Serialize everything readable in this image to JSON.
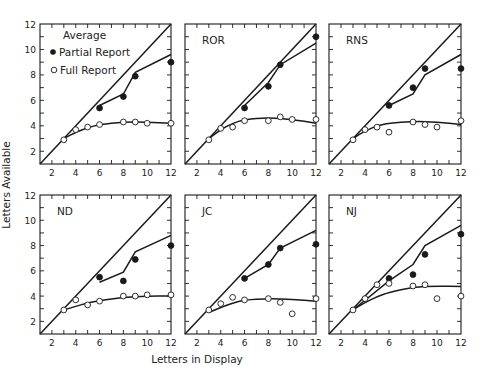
{
  "figure": {
    "xlabel": "Letters in Display",
    "ylabel": "Letters Available",
    "colors": {
      "ink": "#1a1a1a",
      "background": "#ffffff",
      "open_marker_fill": "#ffffff"
    },
    "legend": {
      "title": "Average",
      "items": [
        {
          "label": "Partial Report",
          "marker": "filled-circle"
        },
        {
          "label": "Full Report",
          "marker": "open-circle"
        }
      ]
    }
  },
  "chart_data": [
    {
      "type": "line",
      "title": "Average",
      "panel_label": "",
      "xlabel": "Letters in Display",
      "ylabel": "Letters Available",
      "xlim": [
        1,
        12
      ],
      "ylim": [
        1,
        12
      ],
      "xticks": [
        2,
        4,
        6,
        8,
        10,
        12
      ],
      "yticks": [
        2,
        4,
        6,
        8,
        10,
        12
      ],
      "grid": false,
      "diagonal": [
        [
          1,
          1
        ],
        [
          12,
          12
        ]
      ],
      "series": [
        {
          "name": "Partial Report",
          "marker": "filled",
          "x": [
            6,
            8,
            9,
            12
          ],
          "values": [
            5.4,
            6.3,
            7.9,
            9.0
          ]
        },
        {
          "name": "Full Report",
          "marker": "open",
          "x": [
            3,
            4,
            5,
            6,
            8,
            9,
            10,
            12
          ],
          "values": [
            2.9,
            3.7,
            3.9,
            4.1,
            4.3,
            4.3,
            4.2,
            4.2
          ]
        }
      ],
      "fit_lines": {
        "partial": [
          [
            6,
            5.6
          ],
          [
            8,
            6.5
          ],
          [
            9,
            8.2
          ],
          [
            12,
            9.6
          ]
        ],
        "full": [
          [
            3,
            3.0
          ],
          [
            4,
            3.5
          ],
          [
            5,
            3.85
          ],
          [
            6,
            4.1
          ],
          [
            8,
            4.3
          ],
          [
            10,
            4.3
          ],
          [
            12,
            4.2
          ]
        ]
      }
    },
    {
      "type": "line",
      "title": "ROR",
      "panel_label": "ROR",
      "xlim": [
        1,
        12
      ],
      "ylim": [
        1,
        12
      ],
      "xticks": [
        2,
        4,
        6,
        8,
        10,
        12
      ],
      "yticks": [
        2,
        4,
        6,
        8,
        10,
        12
      ],
      "grid": false,
      "diagonal": [
        [
          1,
          1
        ],
        [
          12,
          12
        ]
      ],
      "series": [
        {
          "name": "Partial Report",
          "marker": "filled",
          "x": [
            6,
            8,
            9,
            12
          ],
          "values": [
            5.4,
            7.1,
            8.8,
            11.0
          ]
        },
        {
          "name": "Full Report",
          "marker": "open",
          "x": [
            3,
            4,
            5,
            6,
            8,
            9,
            10,
            12
          ],
          "values": [
            2.9,
            3.8,
            3.9,
            4.4,
            4.4,
            4.7,
            4.5,
            4.5
          ]
        }
      ],
      "fit_lines": {
        "partial": [
          [
            6,
            5.6
          ],
          [
            8,
            7.4
          ],
          [
            9,
            8.8
          ],
          [
            12,
            10.5
          ]
        ],
        "full": [
          [
            3,
            3.0
          ],
          [
            4,
            3.7
          ],
          [
            5,
            4.2
          ],
          [
            6,
            4.5
          ],
          [
            8,
            4.65
          ],
          [
            10,
            4.5
          ],
          [
            12,
            4.2
          ]
        ]
      }
    },
    {
      "type": "line",
      "title": "RNS",
      "panel_label": "RNS",
      "xlim": [
        1,
        12
      ],
      "ylim": [
        1,
        12
      ],
      "xticks": [
        2,
        4,
        6,
        8,
        10,
        12
      ],
      "yticks": [
        2,
        4,
        6,
        8,
        10,
        12
      ],
      "grid": false,
      "diagonal": [
        [
          1,
          1
        ],
        [
          12,
          12
        ]
      ],
      "series": [
        {
          "name": "Partial Report",
          "marker": "filled",
          "x": [
            6,
            8,
            9,
            12
          ],
          "values": [
            5.6,
            7.0,
            8.5,
            8.5
          ]
        },
        {
          "name": "Full Report",
          "marker": "open",
          "x": [
            3,
            4,
            5,
            6,
            8,
            9,
            10,
            12
          ],
          "values": [
            2.9,
            3.7,
            3.9,
            3.5,
            4.3,
            4.1,
            3.9,
            4.4
          ]
        }
      ],
      "fit_lines": {
        "partial": [
          [
            6,
            5.6
          ],
          [
            8,
            6.5
          ],
          [
            9,
            8.0
          ],
          [
            12,
            9.6
          ]
        ],
        "full": [
          [
            3,
            3.0
          ],
          [
            4,
            3.6
          ],
          [
            5,
            4.0
          ],
          [
            6,
            4.2
          ],
          [
            8,
            4.35
          ],
          [
            10,
            4.3
          ],
          [
            12,
            4.1
          ]
        ]
      }
    },
    {
      "type": "line",
      "title": "ND",
      "panel_label": "ND",
      "xlim": [
        1,
        12
      ],
      "ylim": [
        1,
        12
      ],
      "xticks": [
        2,
        4,
        6,
        8,
        10,
        12
      ],
      "yticks": [
        2,
        4,
        6,
        8,
        10,
        12
      ],
      "grid": false,
      "diagonal": [
        [
          1,
          1
        ],
        [
          12,
          12
        ]
      ],
      "series": [
        {
          "name": "Partial Report",
          "marker": "filled",
          "x": [
            6,
            8,
            9,
            12
          ],
          "values": [
            5.5,
            5.2,
            6.9,
            8.0
          ]
        },
        {
          "name": "Full Report",
          "marker": "open",
          "x": [
            3,
            4,
            5,
            6,
            8,
            9,
            10,
            12
          ],
          "values": [
            2.9,
            3.7,
            3.3,
            3.6,
            4.0,
            4.0,
            4.1,
            4.1
          ]
        }
      ],
      "fit_lines": {
        "partial": [
          [
            6,
            5.1
          ],
          [
            8,
            5.9
          ],
          [
            9,
            7.5
          ],
          [
            12,
            8.8
          ]
        ],
        "full": [
          [
            3,
            2.9
          ],
          [
            4,
            3.2
          ],
          [
            5,
            3.45
          ],
          [
            6,
            3.65
          ],
          [
            8,
            3.9
          ],
          [
            10,
            4.0
          ],
          [
            12,
            4.0
          ]
        ]
      }
    },
    {
      "type": "line",
      "title": "JC",
      "panel_label": "JC",
      "xlim": [
        1,
        12
      ],
      "ylim": [
        1,
        12
      ],
      "xticks": [
        2,
        4,
        6,
        8,
        10,
        12
      ],
      "yticks": [
        2,
        4,
        6,
        8,
        10,
        12
      ],
      "grid": false,
      "diagonal": [
        [
          1,
          1
        ],
        [
          12,
          12
        ]
      ],
      "series": [
        {
          "name": "Partial Report",
          "marker": "filled",
          "x": [
            6,
            8,
            9,
            12
          ],
          "values": [
            5.4,
            6.5,
            7.8,
            8.1
          ]
        },
        {
          "name": "Full Report",
          "marker": "open",
          "x": [
            3,
            4,
            5,
            6,
            8,
            9,
            10,
            12
          ],
          "values": [
            2.9,
            3.4,
            3.9,
            3.7,
            3.8,
            3.5,
            2.6,
            3.8
          ]
        }
      ],
      "fit_lines": {
        "partial": [
          [
            6,
            5.4
          ],
          [
            8,
            6.5
          ],
          [
            9,
            7.8
          ],
          [
            12,
            9.2
          ]
        ],
        "full": [
          [
            3,
            2.7
          ],
          [
            4,
            3.1
          ],
          [
            5,
            3.45
          ],
          [
            6,
            3.7
          ],
          [
            8,
            3.8
          ],
          [
            10,
            3.75
          ],
          [
            12,
            3.6
          ]
        ]
      }
    },
    {
      "type": "line",
      "title": "NJ",
      "panel_label": "NJ",
      "xlim": [
        1,
        12
      ],
      "ylim": [
        1,
        12
      ],
      "xticks": [
        2,
        4,
        6,
        8,
        10,
        12
      ],
      "yticks": [
        2,
        4,
        6,
        8,
        10,
        12
      ],
      "grid": false,
      "diagonal": [
        [
          1,
          1
        ],
        [
          12,
          12
        ]
      ],
      "series": [
        {
          "name": "Partial Report",
          "marker": "filled",
          "x": [
            6,
            8,
            9,
            12
          ],
          "values": [
            5.4,
            5.7,
            7.3,
            8.9
          ]
        },
        {
          "name": "Full Report",
          "marker": "open",
          "x": [
            3,
            4,
            5,
            6,
            8,
            9,
            10,
            12
          ],
          "values": [
            2.9,
            3.8,
            4.9,
            5.0,
            4.8,
            4.9,
            3.8,
            4.0
          ]
        }
      ],
      "fit_lines": {
        "partial": [
          [
            3,
            2.9
          ],
          [
            6,
            5.2
          ],
          [
            8,
            6.5
          ],
          [
            9,
            8.0
          ],
          [
            12,
            9.6
          ]
        ],
        "full": [
          [
            3,
            2.9
          ],
          [
            4,
            3.5
          ],
          [
            5,
            3.95
          ],
          [
            6,
            4.3
          ],
          [
            8,
            4.7
          ],
          [
            10,
            4.8
          ],
          [
            12,
            4.75
          ]
        ]
      }
    }
  ]
}
